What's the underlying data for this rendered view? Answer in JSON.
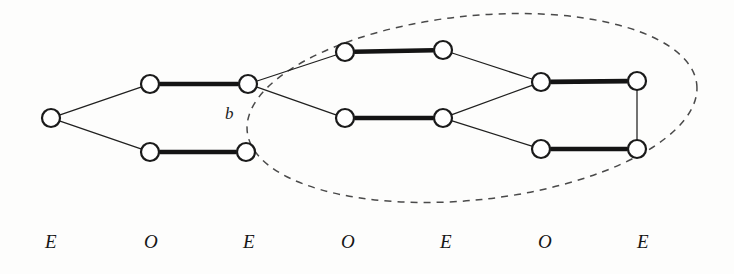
{
  "figure": {
    "kind": "graph-diagram",
    "background_color": "#fdfdfc",
    "ink_color": "#161616",
    "dashed_color": "#4a4a4a"
  },
  "parity_labels": [
    {
      "text": "E",
      "x": 45,
      "y": 232
    },
    {
      "text": "O",
      "x": 144,
      "y": 232
    },
    {
      "text": "E",
      "x": 243,
      "y": 232
    },
    {
      "text": "O",
      "x": 341,
      "y": 232
    },
    {
      "text": "E",
      "x": 440,
      "y": 232
    },
    {
      "text": "O",
      "x": 538,
      "y": 232
    },
    {
      "text": "E",
      "x": 637,
      "y": 232
    }
  ],
  "vertex_labels": [
    {
      "text": "b",
      "x": 225,
      "y": 105
    }
  ],
  "nodes": [
    {
      "id": "v1",
      "cx": 51,
      "cy": 118,
      "r": 9,
      "column": 1,
      "parity": "E"
    },
    {
      "id": "v2u",
      "cx": 150,
      "cy": 84,
      "r": 9,
      "column": 2,
      "parity": "O"
    },
    {
      "id": "v2l",
      "cx": 150,
      "cy": 152,
      "r": 9,
      "column": 2,
      "parity": "O"
    },
    {
      "id": "v3u",
      "cx": 248,
      "cy": 84,
      "r": 9,
      "column": 3,
      "parity": "E"
    },
    {
      "id": "v3l",
      "cx": 246,
      "cy": 152,
      "r": 9,
      "column": 3,
      "parity": "E"
    },
    {
      "id": "v4u",
      "cx": 345,
      "cy": 52,
      "r": 9,
      "column": 4,
      "parity": "O"
    },
    {
      "id": "v4l",
      "cx": 345,
      "cy": 118,
      "r": 9,
      "column": 4,
      "parity": "O"
    },
    {
      "id": "v5u",
      "cx": 443,
      "cy": 50,
      "r": 9,
      "column": 5,
      "parity": "E"
    },
    {
      "id": "v5l",
      "cx": 443,
      "cy": 118,
      "r": 9,
      "column": 5,
      "parity": "E"
    },
    {
      "id": "v6u",
      "cx": 541,
      "cy": 82,
      "r": 9,
      "column": 6,
      "parity": "O"
    },
    {
      "id": "v6l",
      "cx": 541,
      "cy": 149,
      "r": 9,
      "column": 6,
      "parity": "O"
    },
    {
      "id": "v7u",
      "cx": 637,
      "cy": 81,
      "r": 9,
      "column": 7,
      "parity": "E"
    },
    {
      "id": "v7l",
      "cx": 637,
      "cy": 149,
      "r": 9,
      "column": 7,
      "parity": "E"
    }
  ],
  "edges_thin": [
    {
      "from": "v1",
      "to": "v2u"
    },
    {
      "from": "v1",
      "to": "v2l"
    },
    {
      "from": "v3u",
      "to": "v4u"
    },
    {
      "from": "v3u",
      "to": "v4l"
    },
    {
      "from": "v5u",
      "to": "v6u"
    },
    {
      "from": "v5l",
      "to": "v6u"
    },
    {
      "from": "v5l",
      "to": "v6l"
    },
    {
      "from": "v7u",
      "to": "v7l"
    }
  ],
  "edges_thick": [
    {
      "from": "v2u",
      "to": "v3u"
    },
    {
      "from": "v2l",
      "to": "v3l"
    },
    {
      "from": "v4u",
      "to": "v5u"
    },
    {
      "from": "v4l",
      "to": "v5l"
    },
    {
      "from": "v6u",
      "to": "v7u"
    },
    {
      "from": "v6l",
      "to": "v7l"
    }
  ],
  "region": {
    "shape": "ellipse",
    "cx": 472,
    "cy": 108,
    "rx": 226,
    "ry": 92,
    "rotation_deg": -6,
    "style": "dashed"
  }
}
